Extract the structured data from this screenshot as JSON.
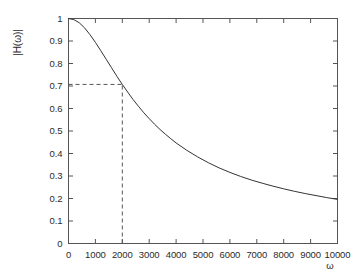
{
  "chart_data": {
    "type": "line",
    "title": "",
    "subtitle": "",
    "xlabel": "ω",
    "ylabel": "|H(ω)|",
    "xlim": [
      0,
      10000
    ],
    "ylim": [
      0,
      1
    ],
    "grid": false,
    "legend": null,
    "frame": "box",
    "tick_direction": "in",
    "line_color": "#333333",
    "background_color": "#ffffff",
    "axis_color": "#555555",
    "x_ticks": [
      0,
      1000,
      2000,
      3000,
      4000,
      5000,
      6000,
      7000,
      8000,
      9000,
      10000
    ],
    "x_tick_labels": [
      "0",
      "1000",
      "2000",
      "3000",
      "4000",
      "5000",
      "6000",
      "7000",
      "8000",
      "9000",
      "10000"
    ],
    "y_ticks": [
      0,
      0.1,
      0.2,
      0.3,
      0.4,
      0.5,
      0.6,
      0.7,
      0.8,
      0.9,
      1
    ],
    "y_tick_labels": [
      "0",
      "0.1",
      "0.2",
      "0.3",
      "0.4",
      "0.5",
      "0.6",
      "0.7",
      "0.8",
      "0.9",
      "1"
    ],
    "series": [
      {
        "name": "|H(ω)|",
        "x": [
          0,
          200,
          400,
          600,
          800,
          1000,
          1200,
          1400,
          1600,
          1800,
          2000,
          2200,
          2400,
          2600,
          2800,
          3000,
          3200,
          3400,
          3600,
          3800,
          4000,
          4400,
          4800,
          5200,
          5600,
          6000,
          6400,
          6800,
          7200,
          7600,
          8000,
          8400,
          8800,
          9200,
          9600,
          10000
        ],
        "y": [
          1.0,
          0.995,
          0.981,
          0.958,
          0.928,
          0.894,
          0.857,
          0.819,
          0.781,
          0.743,
          0.707,
          0.673,
          0.64,
          0.61,
          0.581,
          0.555,
          0.53,
          0.507,
          0.486,
          0.466,
          0.447,
          0.414,
          0.385,
          0.359,
          0.336,
          0.316,
          0.298,
          0.282,
          0.268,
          0.255,
          0.243,
          0.232,
          0.222,
          0.213,
          0.204,
          0.196
        ]
      }
    ],
    "annotations": [
      {
        "name": "cutoff-horizontal",
        "style": "dashed",
        "from": [
          0,
          0.707
        ],
        "to": [
          2000,
          0.707
        ]
      },
      {
        "name": "cutoff-vertical",
        "style": "dashed",
        "from": [
          2000,
          0
        ],
        "to": [
          2000,
          0.707
        ]
      }
    ],
    "cutoff": {
      "omega": 2000,
      "magnitude": 0.707
    }
  },
  "axes": {
    "y_label": "|H(ω)|",
    "x_label": "ω",
    "y_tick_labels": [
      "1",
      "0.9",
      "0.8",
      "0.7",
      "0.6",
      "0.5",
      "0.4",
      "0.3",
      "0.2",
      "0.1",
      "0"
    ],
    "x_tick_labels": [
      "0",
      "1000",
      "2000",
      "3000",
      "4000",
      "5000",
      "6000",
      "7000",
      "8000",
      "9000",
      "10000"
    ]
  }
}
